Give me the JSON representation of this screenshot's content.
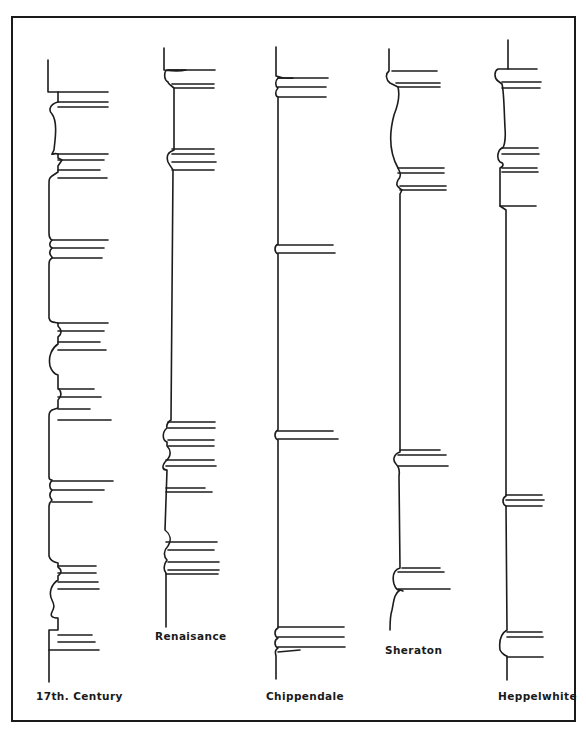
{
  "figure": {
    "type": "diagram",
    "frame_color": "#1a1a1a",
    "line_color": "#1c1c1c",
    "background": "#ffffff"
  },
  "profiles": [
    {
      "id": "17th-century",
      "label": "17th. Century",
      "label_pos": {
        "x": 36,
        "y": 700
      },
      "path": "M48 60 L48 92 L58 92 L58 102 C50 104 48 110 52 114 C58 122 55 140 54 150 C50 158 52 152 58 154 L58 158 L62 160 L58 166 L58 172 L52 176 C49 178 49 180 49 184 L49 233 C49 239 52 240 52 240 C49 243 49 246 52 248 C49 251 49 254 52 257 L52 258 C49 260 49 262 49 266 L49 318 C50 322 52 322 58 323 L58 326 C62 330 62 334 58 337 L58 344 C52 348 48 356 50 366 C52 372 54 374 58 375 L58 388 C62 392 62 396 58 400 L58 408 L52 410 C49 412 49 414 49 418 L49 477 C49 480 52 480 52 480 C49 484 49 488 52 490 C49 494 49 497 52 500 C50 502 49 504 49 506 L49 556 C50 560 52 562 58 563 L58 567 C62 570 62 573 58 576 L58 580 C52 584 48 592 52 600 C55 606 54 608 52 612 C50 616 52 618 58 618 L58 630 L49 630 L49 682",
      "lines": [
        [
          58,
          92,
          108,
          92
        ],
        [
          58,
          102,
          108,
          102
        ],
        [
          58,
          107,
          108,
          107
        ],
        [
          58,
          154,
          108,
          154
        ],
        [
          58,
          160,
          104,
          160
        ],
        [
          58,
          170,
          100,
          170
        ],
        [
          58,
          178,
          107,
          178
        ],
        [
          52,
          240,
          108,
          240
        ],
        [
          52,
          248,
          104,
          248
        ],
        [
          52,
          258,
          102,
          258
        ],
        [
          58,
          323,
          108,
          323
        ],
        [
          58,
          331,
          104,
          331
        ],
        [
          58,
          342,
          100,
          342
        ],
        [
          58,
          350,
          106,
          350
        ],
        [
          58,
          389,
          94,
          389
        ],
        [
          58,
          397,
          101,
          397
        ],
        [
          58,
          409,
          90,
          409
        ],
        [
          58,
          420,
          111,
          420
        ],
        [
          52,
          481,
          113,
          481
        ],
        [
          52,
          490,
          104,
          490
        ],
        [
          52,
          502,
          92,
          502
        ],
        [
          58,
          566,
          96,
          566
        ],
        [
          58,
          573,
          96,
          573
        ],
        [
          58,
          582,
          98,
          582
        ],
        [
          58,
          589,
          99,
          589
        ],
        [
          58,
          635,
          92,
          635
        ],
        [
          58,
          642,
          95,
          642
        ],
        [
          49,
          650,
          99,
          650
        ]
      ]
    },
    {
      "id": "renaissance",
      "label": "Renaisance",
      "label_pos": {
        "x": 157,
        "y": 640
      },
      "path": "M164 48 L164 70 C172 71 178 72 186 70 L166 70 C164 74 164 80 168 82 C168 84 172 86 174 88 L174 150 C168 152 166 156 168 162 C170 166 172 168 173 170 L171 420 C168 422 166 424 167 428 C162 432 162 440 167 442 L167 446 C171 450 172 456 165 462 C162 466 162 470 167 470 L165 530 C170 534 172 540 168 546 C164 550 163 556 167 560 C164 564 163 570 166 573 L166 627",
      "lines": [
        [
          168,
          70,
          215,
          70
        ],
        [
          172,
          84,
          214,
          84
        ],
        [
          174,
          88,
          214,
          88
        ],
        [
          172,
          149,
          214,
          149
        ],
        [
          172,
          154,
          214,
          154
        ],
        [
          172,
          162,
          216,
          162
        ],
        [
          172,
          170,
          214,
          170
        ],
        [
          168,
          422,
          215,
          422
        ],
        [
          168,
          428,
          215,
          428
        ],
        [
          168,
          440,
          214,
          440
        ],
        [
          168,
          446,
          214,
          446
        ],
        [
          166,
          460,
          214,
          460
        ],
        [
          166,
          466,
          216,
          466
        ],
        [
          166,
          488,
          205,
          488
        ],
        [
          166,
          492,
          212,
          492
        ],
        [
          166,
          542,
          217,
          542
        ],
        [
          168,
          550,
          214,
          550
        ],
        [
          168,
          562,
          219,
          562
        ],
        [
          168,
          570,
          219,
          570
        ],
        [
          166,
          574,
          218,
          574
        ]
      ]
    },
    {
      "id": "chippendale",
      "label": "Chippendale",
      "label_pos": {
        "x": 267,
        "y": 700
      },
      "path": "M276 47 L276 76 C282 78 286 79 293 78 L278 78 C275 81 275 86 278 88 C275 91 275 96 278 97 L278 244 C274 246 274 252 278 254 L278 430 C274 432 274 438 278 440 L278 628 C274 630 274 636 278 638 C274 640 274 646 278 648 C275 650 275 652 276 656 L276 679",
      "lines": [
        [
          278,
          78,
          328,
          78
        ],
        [
          278,
          87,
          326,
          87
        ],
        [
          278,
          97,
          326,
          97
        ],
        [
          278,
          245,
          333,
          245
        ],
        [
          278,
          253,
          335,
          253
        ],
        [
          278,
          431,
          333,
          431
        ],
        [
          278,
          439,
          338,
          439
        ],
        [
          278,
          627,
          344,
          627
        ],
        [
          278,
          637,
          344,
          637
        ],
        [
          278,
          647,
          345,
          647
        ],
        [
          278,
          652,
          300,
          650
        ]
      ]
    },
    {
      "id": "sheraton",
      "label": "Sheraton",
      "label_pos": {
        "x": 386,
        "y": 653
      },
      "path": "M389 49 L389 71 C385 74 386 80 390 83 L398 87 C400 95 398 105 394 115 C390 130 388 150 398 168 C400 172 402 176 398 180 C396 184 396 186 402 190 L400 194 L400 452 C394 454 392 460 396 464 C398 466 400 470 399 476 L400 568 C394 570 392 576 394 584 C396 590 398 590 400 590 C394 594 394 600 392 610 C390 616 390 620 390 630",
      "lines": [
        [
          392,
          71,
          437,
          71
        ],
        [
          396,
          83,
          440,
          83
        ],
        [
          398,
          87,
          440,
          87
        ],
        [
          398,
          168,
          444,
          168
        ],
        [
          398,
          173,
          444,
          173
        ],
        [
          400,
          186,
          446,
          186
        ],
        [
          400,
          190,
          446,
          190
        ],
        [
          400,
          450,
          440,
          450
        ],
        [
          398,
          455,
          446,
          455
        ],
        [
          398,
          466,
          448,
          466
        ],
        [
          402,
          568,
          440,
          568
        ],
        [
          398,
          572,
          444,
          572
        ],
        [
          398,
          589,
          450,
          589
        ],
        [
          400,
          590,
          403,
          591
        ]
      ]
    },
    {
      "id": "hepplewhite",
      "label": "Heppelwhite",
      "label_pos": {
        "x": 500,
        "y": 700
      },
      "path": "M508 40 L508 69 L498 69 C494 71 494 78 498 81 L502 84 C504 92 504 108 505 128 C506 140 504 148 502 148 C498 150 496 158 500 162 C504 163 504 166 500 168 L500 206 L506 210 L506 496 C502 498 502 504 506 506 L507 630 C500 634 499 642 500 650 C502 654 506 656 507 656 L507 680",
      "lines": [
        [
          508,
          69,
          537,
          69
        ],
        [
          502,
          82,
          541,
          82
        ],
        [
          502,
          88,
          540,
          88
        ],
        [
          502,
          148,
          538,
          148
        ],
        [
          502,
          154,
          539,
          154
        ],
        [
          502,
          168,
          537,
          168
        ],
        [
          502,
          172,
          538,
          172
        ],
        [
          500,
          206,
          536,
          206
        ],
        [
          506,
          495,
          542,
          495
        ],
        [
          506,
          500,
          544,
          500
        ],
        [
          506,
          506,
          542,
          506
        ],
        [
          507,
          632,
          542,
          632
        ],
        [
          507,
          637,
          543,
          637
        ],
        [
          507,
          657,
          543,
          657
        ]
      ]
    }
  ],
  "labels": {
    "century17": "17th. Century",
    "renaissance": "Renaisance",
    "chippendale": "Chippendale",
    "sheraton": "Sheraton",
    "hepplewhite": "Heppelwhite"
  }
}
